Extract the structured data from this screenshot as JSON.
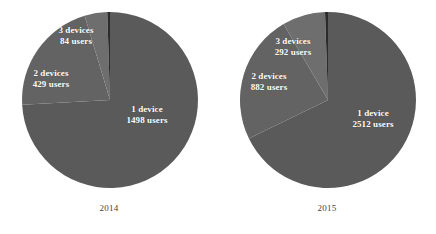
{
  "figure": {
    "background_color": "#ffffff",
    "label_text_color": "#ffffff",
    "caption_text_color": "#3f3f3f"
  },
  "panels": [
    {
      "id": "2014",
      "caption": "2014",
      "labels": [
        {
          "name": "3-devices",
          "line1": "3 devices",
          "line2": "84 users"
        },
        {
          "name": "2-devices",
          "line1": "2 devices",
          "line2": "429 users"
        },
        {
          "name": "1-device",
          "line1": "1 device",
          "line2": "1498 users"
        }
      ]
    },
    {
      "id": "2015",
      "caption": "2015",
      "labels": [
        {
          "name": "3-devices",
          "line1": "3 devices",
          "line2": "292 users"
        },
        {
          "name": "2-devices",
          "line1": "2 devices",
          "line2": "882 users"
        },
        {
          "name": "1-device",
          "line1": "1 device",
          "line2": "2512 users"
        }
      ]
    }
  ],
  "chart_data": [
    {
      "type": "pie",
      "title": "2014",
      "categories": [
        "1 device",
        "2 devices",
        "3 devices",
        "4+ devices"
      ],
      "values": [
        1498,
        429,
        84,
        10
      ],
      "value_unit": "users",
      "total": 2021,
      "percentages": [
        74.1,
        21.2,
        4.2,
        0.5
      ],
      "data_labels": [
        "1 device\n1498 users",
        "2 devices\n429 users",
        "3 devices\n84 users",
        ""
      ],
      "colors": [
        "#5a5a5a",
        "#636363",
        "#6e6e6e",
        "#2b2b2b"
      ],
      "legend": "none",
      "start_angle_deg": -90,
      "direction": "clockwise"
    },
    {
      "type": "pie",
      "title": "2015",
      "categories": [
        "1 device",
        "2 devices",
        "3 devices",
        "4+ devices"
      ],
      "values": [
        2512,
        882,
        292,
        20
      ],
      "value_unit": "users",
      "total": 3706,
      "percentages": [
        67.8,
        23.8,
        7.9,
        0.5
      ],
      "data_labels": [
        "1 device\n2512 users",
        "2 devices\n882 users",
        "3 devices\n292 users",
        ""
      ],
      "colors": [
        "#5a5a5a",
        "#636363",
        "#6e6e6e",
        "#2b2b2b"
      ],
      "legend": "none",
      "start_angle_deg": -90,
      "direction": "clockwise"
    }
  ]
}
